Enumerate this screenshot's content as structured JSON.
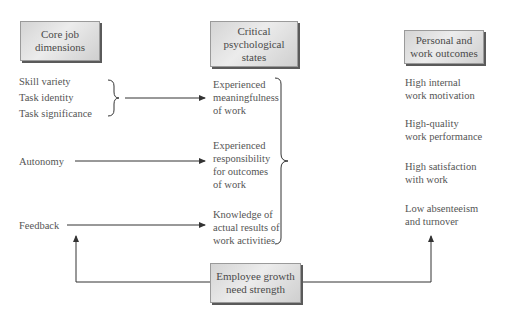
{
  "headers": {
    "core": "Core job\ndimensions",
    "critical": "Critical\npsychological\nstates",
    "outcomes": "Personal and\nwork outcomes",
    "moderator": "Employee growth\nneed strength"
  },
  "core_dimensions": [
    "Skill variety",
    "Task identity",
    "Task significance",
    "Autonomy",
    "Feedback"
  ],
  "psychological_states": [
    "Experienced\nmeaningfulness\nof work",
    "Experienced\nresponsibility\nfor outcomes\nof work",
    "Knowledge of\nactual results of\nwork activities"
  ],
  "outcomes": [
    "High internal\nwork motivation",
    "High-quality\nwork performance",
    "High satisfaction\nwith work",
    "Low absenteeism\nand turnover"
  ],
  "colors": {
    "line": "#333333",
    "box_shadow": "#5a5a5a",
    "text": "#555555"
  }
}
